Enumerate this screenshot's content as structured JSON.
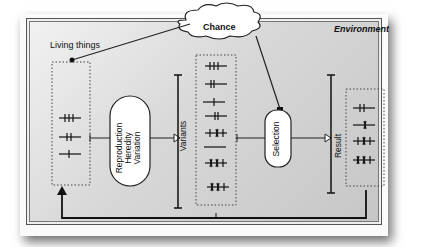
{
  "diagram": {
    "environment_label": "Environment",
    "chance_label": "Chance",
    "living_things_label": "Living things",
    "process_label": [
      "Reproduction",
      "Heredity",
      "Variation"
    ],
    "variants_label": "Variants",
    "selection_label": "Selection",
    "result_label": "Result",
    "living_things_items": 3,
    "variants_items": 8,
    "result_items": 4
  }
}
